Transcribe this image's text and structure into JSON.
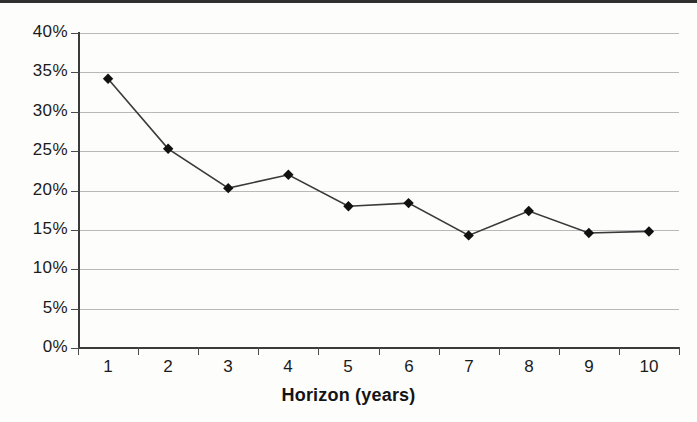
{
  "chart_data": {
    "type": "line",
    "title": "",
    "xlabel": "Horizon (years)",
    "ylabel": "",
    "categories": [
      "1",
      "2",
      "3",
      "4",
      "5",
      "6",
      "7",
      "8",
      "9",
      "10"
    ],
    "values": [
      34.2,
      25.3,
      20.3,
      22.0,
      18.0,
      18.4,
      14.3,
      17.4,
      14.6,
      14.8
    ],
    "series": [
      {
        "name": "",
        "values": [
          34.2,
          25.3,
          20.3,
          22.0,
          18.0,
          18.4,
          14.3,
          17.4,
          14.6,
          14.8
        ]
      }
    ],
    "ylim": [
      0,
      40
    ],
    "ytick_values": [
      0,
      5,
      10,
      15,
      20,
      25,
      30,
      35,
      40
    ],
    "ytick_labels": [
      "0%",
      "5%",
      "10%",
      "15%",
      "20%",
      "25%",
      "30%",
      "35%",
      "40%"
    ],
    "xtick_labels": [
      "1",
      "2",
      "3",
      "4",
      "5",
      "6",
      "7",
      "8",
      "9",
      "10"
    ],
    "grid": "horizontal",
    "legend": "none",
    "marker": "diamond",
    "marker_color": "#111111",
    "line_color": "#3a3a3a",
    "annotations": []
  },
  "axes": {
    "x_title": "Horizon (years)"
  }
}
